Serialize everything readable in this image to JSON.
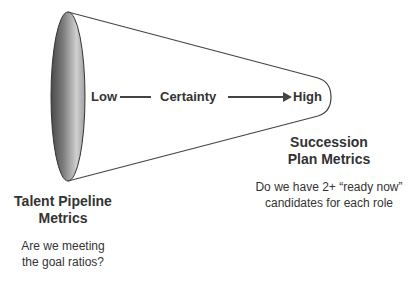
{
  "diagram": {
    "type": "funnel",
    "axis": {
      "low_label": "Low",
      "middle_label": "Certainty",
      "high_label": "High"
    },
    "left": {
      "heading_line1": "Talent Pipeline",
      "heading_line2": "Metrics",
      "question_line1": "Are we meeting",
      "question_line2": "the goal ratios?"
    },
    "right": {
      "heading_line1": "Succession",
      "heading_line2": "Plan Metrics",
      "question_line1": "Do we have 2+ “ready now”",
      "question_line2": "candidates for each role"
    },
    "colors": {
      "outline": "#444444",
      "text": "#333333",
      "ellipse_dark": "#5a5a5a",
      "ellipse_light": "#e0e0e0"
    }
  }
}
